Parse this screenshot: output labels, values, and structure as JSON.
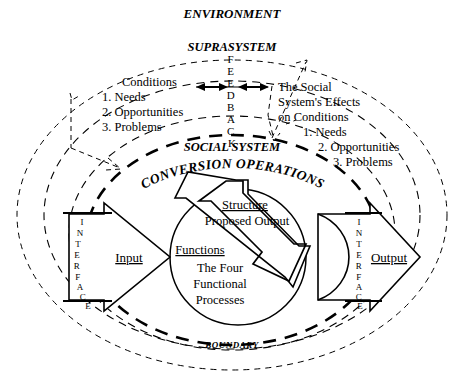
{
  "diagram": {
    "labels": {
      "environment": "ENVIRONMENT",
      "suprasystem": "SUPRASYSTEM",
      "social_system": "SOCIAL SYSTEM",
      "conversion_operations": "CONVERSION OPERATIONS",
      "boundary": "BOUNDARY",
      "feedback": "FEEDBACK",
      "interface_left": "INTERFACE",
      "interface_right": "INTERFACE",
      "input": "Input",
      "output": "Output",
      "structure": "Structure",
      "proposed_output": "Proposed Output",
      "functions": "Functions",
      "four_line1": "The Four",
      "four_line2": "Functional",
      "four_line3": "Processes"
    },
    "conditions_block": {
      "heading": "Conditions",
      "items": [
        "1. Needs",
        "2. Opportunities",
        "3. Problems"
      ]
    },
    "effects_block": {
      "line1": "The Social",
      "line2": "System's Effects",
      "line3": "on Conditions",
      "items": [
        "1. Needs",
        "2. Opportunities",
        "3. Problems"
      ]
    },
    "colors": {
      "ink": "#000000",
      "paper": "#ffffff"
    }
  }
}
